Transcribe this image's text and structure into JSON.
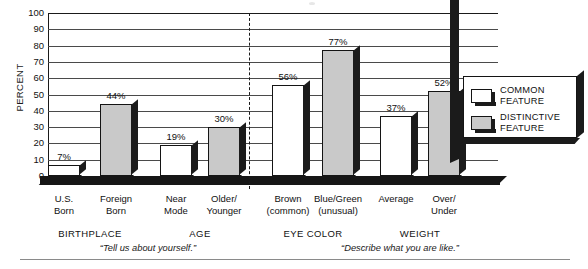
{
  "chart_data": {
    "type": "bar",
    "title": "",
    "xlabel": "",
    "ylabel": "PERCENT",
    "ylim": [
      0,
      100
    ],
    "ytick_step": 10,
    "yticks": [
      "100",
      "90",
      "80",
      "70",
      "60",
      "50",
      "40",
      "30",
      "20",
      "10",
      "0"
    ],
    "grid": true,
    "legend_position": "right-inside",
    "categories": [
      "U.S.\nBorn",
      "Foreign\nBorn",
      "Near\nMode",
      "Older/\nYounger",
      "Brown\n(common)",
      "Blue/Green\n(unusual)",
      "Average",
      "Over/\nUnder"
    ],
    "series": [
      {
        "name": "COMMON\nFEATURE",
        "color": "#ffffff",
        "values": [
          7,
          null,
          19,
          null,
          56,
          null,
          37,
          null
        ]
      },
      {
        "name": "DISTINCTIVE\nFEATURE",
        "color": "#c9c9c9",
        "values": [
          null,
          44,
          null,
          30,
          null,
          77,
          null,
          52
        ]
      }
    ],
    "bars": [
      {
        "category": "U.S.\nBorn",
        "value": 7,
        "label": "7%",
        "series": "COMMON FEATURE"
      },
      {
        "category": "Foreign\nBorn",
        "value": 44,
        "label": "44%",
        "series": "DISTINCTIVE FEATURE"
      },
      {
        "category": "Near\nMode",
        "value": 19,
        "label": "19%",
        "series": "COMMON FEATURE"
      },
      {
        "category": "Older/\nYounger",
        "value": 30,
        "label": "30%",
        "series": "DISTINCTIVE FEATURE"
      },
      {
        "category": "Brown\n(common)",
        "value": 56,
        "label": "56%",
        "series": "COMMON FEATURE"
      },
      {
        "category": "Blue/Green\n(unusual)",
        "value": 77,
        "label": "77%",
        "series": "DISTINCTIVE FEATURE"
      },
      {
        "category": "Average",
        "value": 37,
        "label": "37%",
        "series": "COMMON FEATURE"
      },
      {
        "category": "Over/\nUnder",
        "value": 52,
        "label": "52%",
        "series": "DISTINCTIVE FEATURE"
      }
    ],
    "groups": [
      {
        "name": "BIRTHPLACE",
        "caption": "“Tell us about yourself.”"
      },
      {
        "name": "AGE",
        "caption": "“Tell us about yourself.”"
      },
      {
        "name": "EYE COLOR",
        "caption": "“Describe what you are like.”"
      },
      {
        "name": "WEIGHT",
        "caption": "“Describe what you are like.”"
      }
    ],
    "annotations": [
      {
        "text": "“Tell us about yourself.”",
        "role": "question-caption-left"
      },
      {
        "text": "“Describe what you are like.”",
        "role": "question-caption-right"
      }
    ]
  },
  "axis": {
    "y_title": "PERCENT",
    "ticks": [
      "100",
      "90",
      "80",
      "70",
      "60",
      "50",
      "40",
      "30",
      "20",
      "10",
      "0"
    ]
  },
  "bar_values": [
    "7%",
    "44%",
    "19%",
    "30%",
    "56%",
    "77%",
    "37%",
    "52%"
  ],
  "cat_labels": [
    "U.S.\nBorn",
    "Foreign\nBorn",
    "Near\nMode",
    "Older/\nYounger",
    "Brown\n(common)",
    "Blue/Green\n(unusual)",
    "Average",
    "Over/\nUnder"
  ],
  "group_labels": [
    "BIRTHPLACE",
    "AGE",
    "EYE COLOR",
    "WEIGHT"
  ],
  "captions": {
    "left": "“Tell us about yourself.”",
    "right": "“Describe what you are like.”"
  },
  "legend": {
    "items": [
      {
        "label": "COMMON\nFEATURE",
        "swatch": "white"
      },
      {
        "label": "DISTINCTIVE\nFEATURE",
        "swatch": "gray"
      }
    ]
  },
  "colors": {
    "common_feature": "#ffffff",
    "distinctive_feature": "#c9c9c9",
    "outline": "#141414",
    "shadow": "#1b1b1b",
    "gridline": "#4a4a4a"
  }
}
